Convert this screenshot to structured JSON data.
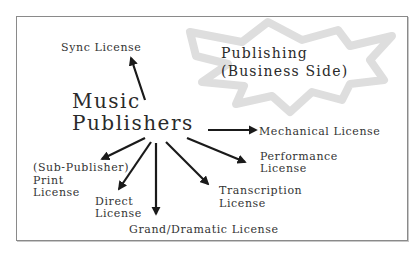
{
  "diagram": {
    "center": {
      "line1": "Music",
      "line2": "Publishers"
    },
    "star": {
      "line1": "Publishing",
      "line2": "(Business Side)",
      "color": "#dedede"
    },
    "licenses": [
      {
        "id": "sync",
        "line1": "Sync License"
      },
      {
        "id": "mechanical",
        "line1": "Mechanical License"
      },
      {
        "id": "performance",
        "line1": "Performance",
        "line2": "License"
      },
      {
        "id": "transcription",
        "line1": "Transcription",
        "line2": "License"
      },
      {
        "id": "grand-dramatic",
        "line1": "Grand/Dramatic License"
      },
      {
        "id": "direct",
        "line1": "Direct",
        "line2": "License"
      },
      {
        "id": "print",
        "line0": "(Sub-Publisher)",
        "line1": "Print",
        "line2": "License"
      }
    ],
    "colors": {
      "text": "#2a2a2a",
      "arrow": "#1a1a1a",
      "border": "#8a8a8a"
    }
  }
}
